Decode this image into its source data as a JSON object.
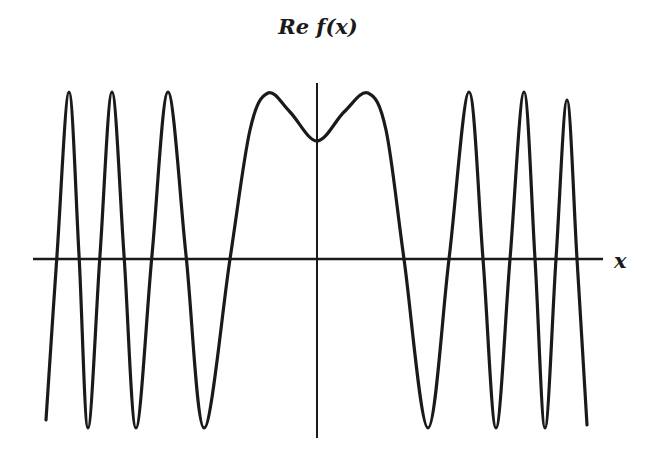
{
  "chart_data": {
    "type": "line",
    "title": "Re f(x)",
    "xlabel": "x",
    "ylabel": "",
    "grid": false,
    "legend": null,
    "axes": {
      "x_axis_pixel": {
        "x0": 33,
        "x1": 603,
        "y": 259
      },
      "y_axis_pixel": {
        "x": 317,
        "y0": 83,
        "y1": 438
      }
    },
    "series": [
      {
        "name": "Re f(x)",
        "color": "#1a1a1a",
        "points_px": [
          [
            46,
            420
          ],
          [
            57,
            255
          ],
          [
            69,
            92
          ],
          [
            79,
            255
          ],
          [
            88,
            428
          ],
          [
            100,
            255
          ],
          [
            112,
            92
          ],
          [
            124,
            255
          ],
          [
            136,
            428
          ],
          [
            152,
            255
          ],
          [
            168,
            92
          ],
          [
            186,
            255
          ],
          [
            204,
            428
          ],
          [
            230,
            259
          ],
          [
            250,
            130
          ],
          [
            268,
            93
          ],
          [
            290,
            112
          ],
          [
            317,
            141
          ],
          [
            344,
            112
          ],
          [
            368,
            93
          ],
          [
            386,
            130
          ],
          [
            404,
            259
          ],
          [
            428,
            428
          ],
          [
            449,
            259
          ],
          [
            469,
            92
          ],
          [
            483,
            259
          ],
          [
            496,
            428
          ],
          [
            510,
            259
          ],
          [
            524,
            92
          ],
          [
            535,
            259
          ],
          [
            545,
            428
          ],
          [
            556,
            259
          ],
          [
            567,
            100
          ],
          [
            577,
            259
          ],
          [
            587,
            425
          ]
        ]
      }
    ]
  },
  "labels": {
    "title": "Re f(x)",
    "x_axis": "x"
  }
}
